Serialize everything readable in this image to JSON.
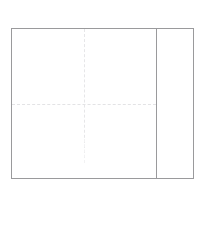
{
  "document": {
    "title": "Drawing Frame",
    "background_color": "#ffffff",
    "canvas_width": "210",
    "canvas_height": "235"
  },
  "frame": {
    "name": "drawing-border",
    "border_color": "#9a9a9c",
    "border_width": "1",
    "fill_color": "#ffffff",
    "left": "11",
    "top": "28",
    "width": "183",
    "height": "151"
  },
  "main_panel": {
    "label": "",
    "fill_color": "#ffffff",
    "width": "144",
    "height": "151"
  },
  "divider": {
    "label": "",
    "color": "#9a9a9c",
    "x": "155",
    "orientation": "vertical"
  },
  "side_panel": {
    "label": "",
    "fill_color": "#ffffff",
    "width": "38",
    "height": "151"
  },
  "guides": {
    "horizontal": {
      "label": "",
      "color": "#e3e3e5",
      "style": "dashed",
      "y": "104"
    },
    "vertical": {
      "label": "",
      "color": "#e6e6e8",
      "style": "dashed",
      "x": "83"
    }
  }
}
